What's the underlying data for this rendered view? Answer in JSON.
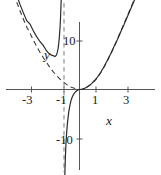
{
  "chart_data": {
    "type": "line",
    "title": "",
    "xlabel": "x",
    "ylabel": "y",
    "xlim": [
      -3.9,
      4.1
    ],
    "ylim": [
      -17.5,
      18.5
    ],
    "grid": false,
    "legend": null,
    "x_ticks": [
      -3,
      -1,
      1,
      3
    ],
    "x_tick_labels": [
      "-3",
      "-1",
      "1",
      "3"
    ],
    "y_ticks": [
      10,
      -10
    ],
    "y_tick_labels": [
      "10",
      "-10"
    ],
    "annotations": [
      {
        "text": "y",
        "x": -1.85,
        "y": 9.0,
        "style": "italic"
      },
      {
        "text": "x",
        "x": 1.55,
        "y": -5.0,
        "style": "italic"
      }
    ],
    "asymptotes": [
      {
        "type": "vertical",
        "x": -1,
        "style": "dashed"
      }
    ],
    "series": [
      {
        "name": "solid-curve",
        "style": "solid",
        "color": "#2b2b2b",
        "points": [
          [
            -3.8,
            19.4
          ],
          [
            -3.6,
            17.5
          ],
          [
            -3.4,
            15.8
          ],
          [
            -3.2,
            14.2
          ],
          [
            -3.0,
            13.5
          ],
          [
            -2.8,
            12.1
          ],
          [
            -2.6,
            10.9
          ],
          [
            -2.4,
            9.9
          ],
          [
            -2.2,
            9.1
          ],
          [
            -2.0,
            8.0
          ],
          [
            -1.9,
            7.6
          ],
          [
            -1.8,
            7.3
          ],
          [
            -1.7,
            7.1
          ],
          [
            -1.6,
            7.0
          ],
          [
            -1.5,
            6.8
          ],
          [
            -1.45,
            6.9
          ],
          [
            -1.4,
            7.1
          ],
          [
            -1.35,
            7.6
          ],
          [
            -1.3,
            8.4
          ],
          [
            -1.26,
            9.4
          ],
          [
            -1.22,
            10.8
          ],
          [
            -1.18,
            12.8
          ],
          [
            -1.15,
            14.8
          ],
          [
            -1.12,
            17.5
          ],
          [
            -1.1,
            19.5
          ],
          [
            -0.9,
            -19.5
          ],
          [
            -0.88,
            -16.5
          ],
          [
            -0.85,
            -13.5
          ],
          [
            -0.82,
            -11.2
          ],
          [
            -0.78,
            -9.0
          ],
          [
            -0.74,
            -7.3
          ],
          [
            -0.7,
            -6.0
          ],
          [
            -0.65,
            -4.6
          ],
          [
            -0.6,
            -3.6
          ],
          [
            -0.55,
            -2.8
          ],
          [
            -0.5,
            -2.1
          ],
          [
            -0.42,
            -1.4
          ],
          [
            -0.34,
            -0.9
          ],
          [
            -0.25,
            -0.5
          ],
          [
            -0.15,
            -0.22
          ],
          [
            -0.05,
            -0.05
          ],
          [
            0.0,
            0.0
          ],
          [
            0.15,
            0.05
          ],
          [
            0.3,
            0.22
          ],
          [
            0.5,
            0.6
          ],
          [
            0.7,
            1.1
          ],
          [
            0.9,
            1.8
          ],
          [
            1.1,
            2.6
          ],
          [
            1.3,
            3.6
          ],
          [
            1.5,
            4.8
          ],
          [
            1.7,
            6.1
          ],
          [
            1.9,
            7.4
          ],
          [
            2.1,
            8.9
          ],
          [
            2.3,
            10.3
          ],
          [
            2.5,
            11.9
          ],
          [
            2.7,
            13.4
          ],
          [
            2.9,
            15.0
          ],
          [
            3.1,
            16.6
          ],
          [
            3.3,
            18.2
          ],
          [
            3.45,
            19.4
          ]
        ]
      },
      {
        "name": "dashed-curve",
        "style": "dashed",
        "color": "#3a3a3a",
        "points": [
          [
            -3.8,
            18.0
          ],
          [
            -3.6,
            16.2
          ],
          [
            -3.4,
            14.5
          ],
          [
            -3.2,
            12.9
          ],
          [
            -3.0,
            11.6
          ],
          [
            -2.8,
            10.2
          ],
          [
            -2.6,
            8.9
          ],
          [
            -2.4,
            7.7
          ],
          [
            -2.2,
            6.6
          ],
          [
            -2.0,
            5.6
          ],
          [
            -1.8,
            4.6
          ],
          [
            -1.6,
            3.7
          ],
          [
            -1.4,
            2.9
          ],
          [
            -1.2,
            2.2
          ],
          [
            -1.0,
            1.6
          ],
          [
            -0.85,
            1.2
          ],
          [
            -0.7,
            0.85
          ],
          [
            -0.55,
            0.55
          ],
          [
            -0.4,
            0.35
          ],
          [
            -0.25,
            0.18
          ],
          [
            -0.1,
            0.05
          ],
          [
            0.0,
            0.0
          ],
          [
            0.2,
            0.1
          ],
          [
            0.4,
            0.38
          ],
          [
            0.6,
            0.8
          ],
          [
            0.8,
            1.4
          ],
          [
            1.0,
            2.1
          ],
          [
            1.2,
            3.0
          ],
          [
            1.4,
            4.1
          ],
          [
            1.6,
            5.3
          ],
          [
            1.8,
            6.7
          ],
          [
            2.0,
            8.1
          ],
          [
            2.2,
            9.6
          ],
          [
            2.4,
            11.2
          ],
          [
            2.6,
            12.8
          ],
          [
            2.8,
            14.4
          ],
          [
            3.0,
            16.0
          ],
          [
            3.2,
            17.6
          ],
          [
            3.4,
            19.2
          ]
        ]
      }
    ]
  },
  "labels": {
    "x_axis": "x",
    "y_axis": "y",
    "tick_neg3": "-3",
    "tick_neg1": "-1",
    "tick_pos1": "1",
    "tick_pos3": "3",
    "tick_pos10": "10",
    "tick_neg10": "-10"
  },
  "colors": {
    "axis": "#555555",
    "curve": "#2b2b2b",
    "asymptote": "#777777",
    "text": "#1a1a1a",
    "background": "#ffffff"
  }
}
